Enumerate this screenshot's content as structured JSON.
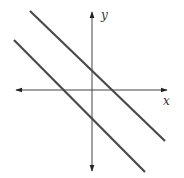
{
  "diagram": {
    "type": "coordinate-plane",
    "axes": {
      "x_label": "x",
      "y_label": "y",
      "color": "#333333"
    },
    "lines": [
      {
        "name": "upper-line",
        "x1": 30,
        "y1": 11,
        "x2": 165,
        "y2": 141,
        "color": "#4a4a4a"
      },
      {
        "name": "lower-line",
        "x1": 14,
        "y1": 40,
        "x2": 145,
        "y2": 172,
        "color": "#4a4a4a"
      }
    ]
  }
}
